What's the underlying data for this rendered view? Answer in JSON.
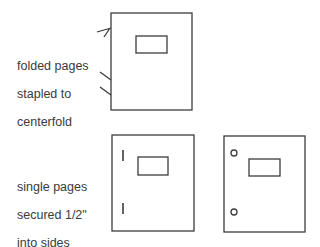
{
  "diagram": {
    "line_color": "#3c3c3c",
    "sections": [
      {
        "id": "folded",
        "label_lines": [
          "folded pages",
          "stapled to",
          "centerfold"
        ],
        "booklets": [
          {
            "binding": "staples-on-fold",
            "marks": [
              "staple-top",
              "staple-middle",
              "staple-bottom"
            ]
          }
        ]
      },
      {
        "id": "single",
        "label_lines": [
          "single pages",
          "secured 1/2\"",
          "into sides"
        ],
        "booklets": [
          {
            "binding": "side-staples",
            "marks": [
              "staple-top",
              "staple-bottom"
            ]
          },
          {
            "binding": "punched-holes",
            "marks": [
              "hole-top",
              "hole-bottom"
            ]
          }
        ]
      }
    ]
  }
}
